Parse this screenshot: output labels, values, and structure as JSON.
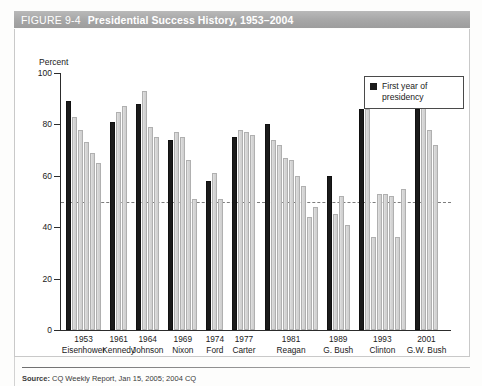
{
  "figure": {
    "number": "FIGURE 9-4",
    "title": "Presidential Success History, 1953–2004"
  },
  "legend": {
    "swatch_name": "black-square-swatch",
    "label": "First year of presidency"
  },
  "source": {
    "prefix": "Source:",
    "text": "CQ Weekly Report, Jan 15, 2005; 2004 CQ"
  },
  "chart_data": {
    "type": "bar",
    "title": "Presidential Success History, 1953–2004",
    "xlabel": "",
    "ylabel": "Percent",
    "ylim": [
      0,
      100
    ],
    "yticks": [
      0,
      20,
      40,
      60,
      80,
      100
    ],
    "ytick_labels": [
      "0",
      "20",
      "40",
      "60",
      "80",
      "100"
    ],
    "grid": false,
    "reference_line": 50,
    "legend_position": "top-right",
    "legend_entries": [
      "First year of presidency"
    ],
    "categories": [
      "1953 Eisenhower",
      "1961 Kennedy",
      "1964 Johnson",
      "1969 Nixon",
      "1974 Ford",
      "1977 Carter",
      "1981 Reagan",
      "1989 G. Bush",
      "1993 Clinton",
      "2001 G.W. Bush"
    ],
    "groups": [
      {
        "year": "1953",
        "president": "Eisenhower",
        "values": [
          89,
          83,
          78,
          73,
          69,
          65
        ]
      },
      {
        "year": "1961",
        "president": "Kennedy",
        "values": [
          81,
          85,
          87
        ]
      },
      {
        "year": "1964",
        "president": "Johnson",
        "values": [
          88,
          93,
          79,
          75
        ]
      },
      {
        "year": "1969",
        "president": "Nixon",
        "values": [
          74,
          77,
          75,
          66,
          51
        ]
      },
      {
        "year": "1974",
        "president": "Ford",
        "values": [
          58,
          61,
          51
        ]
      },
      {
        "year": "1977",
        "president": "Carter",
        "values": [
          75,
          78,
          77,
          76
        ]
      },
      {
        "year": "1981",
        "president": "Reagan",
        "values": [
          80,
          74,
          72,
          67,
          66,
          60,
          56,
          44,
          48
        ]
      },
      {
        "year": "1989",
        "president": "G. Bush",
        "values": [
          60,
          45,
          52,
          41
        ]
      },
      {
        "year": "1993",
        "president": "Clinton",
        "values": [
          86,
          86,
          36,
          53,
          53,
          52,
          36,
          55
        ]
      },
      {
        "year": "2001",
        "president": "G.W. Bush",
        "values": [
          86,
          87,
          78,
          72
        ]
      }
    ],
    "first_year_color": "#1b1b1b",
    "other_years_color": "#d4d4d4"
  }
}
